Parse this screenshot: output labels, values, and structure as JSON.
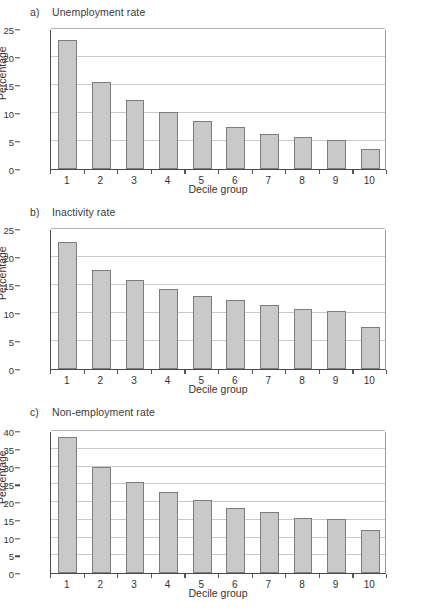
{
  "figure": {
    "ylabel": "Percentage",
    "xlabel": "Decile group",
    "categories": [
      "1",
      "2",
      "3",
      "4",
      "5",
      "6",
      "7",
      "8",
      "9",
      "10"
    ],
    "bar_color": "#c9c9c9",
    "bar_border_color": "#7d7d7d",
    "grid_color": "#c9c9c9",
    "axis_color": "#4a4a4a"
  },
  "panels": [
    {
      "key": "a",
      "letter": "a)",
      "title": "Unemployment rate",
      "yticks": [
        "0",
        "5",
        "10",
        "15",
        "20",
        "25"
      ]
    },
    {
      "key": "b",
      "letter": "b)",
      "title": "Inactivity rate",
      "yticks": [
        "0",
        "5",
        "10",
        "15",
        "20",
        "25"
      ]
    },
    {
      "key": "c",
      "letter": "c)",
      "title": "Non-employment rate",
      "yticks": [
        "0",
        "5",
        "10",
        "15",
        "20",
        "25",
        "30",
        "35",
        "40"
      ]
    }
  ],
  "chart_data": [
    {
      "type": "bar",
      "title": "a)  Unemployment rate",
      "xlabel": "Decile group",
      "ylabel": "Percentage",
      "categories": [
        "1",
        "2",
        "3",
        "4",
        "5",
        "6",
        "7",
        "8",
        "9",
        "10"
      ],
      "values": [
        23.1,
        15.5,
        12.3,
        10.1,
        8.5,
        7.5,
        6.3,
        5.7,
        5.2,
        3.6
      ],
      "ylim": [
        0,
        25
      ],
      "ytick_step": 5,
      "grid": true,
      "legend": "none"
    },
    {
      "type": "bar",
      "title": "b)  Inactivity rate",
      "xlabel": "Decile group",
      "ylabel": "Percentage",
      "categories": [
        "1",
        "2",
        "3",
        "4",
        "5",
        "6",
        "7",
        "8",
        "9",
        "10"
      ],
      "values": [
        22.7,
        17.7,
        15.9,
        14.3,
        13.0,
        12.3,
        11.4,
        10.7,
        10.3,
        7.5
      ],
      "ylim": [
        0,
        25
      ],
      "ytick_step": 5,
      "grid": true,
      "legend": "none"
    },
    {
      "type": "bar",
      "title": "c)  Non-employment rate",
      "xlabel": "Decile group",
      "ylabel": "Percentage",
      "categories": [
        "1",
        "2",
        "3",
        "4",
        "5",
        "6",
        "7",
        "8",
        "9",
        "10"
      ],
      "values": [
        38.2,
        30.0,
        25.5,
        22.8,
        20.5,
        18.4,
        17.2,
        15.6,
        15.1,
        12.1
      ],
      "ylim": [
        0,
        40
      ],
      "ytick_step": 5,
      "grid": true,
      "legend": "none"
    }
  ]
}
